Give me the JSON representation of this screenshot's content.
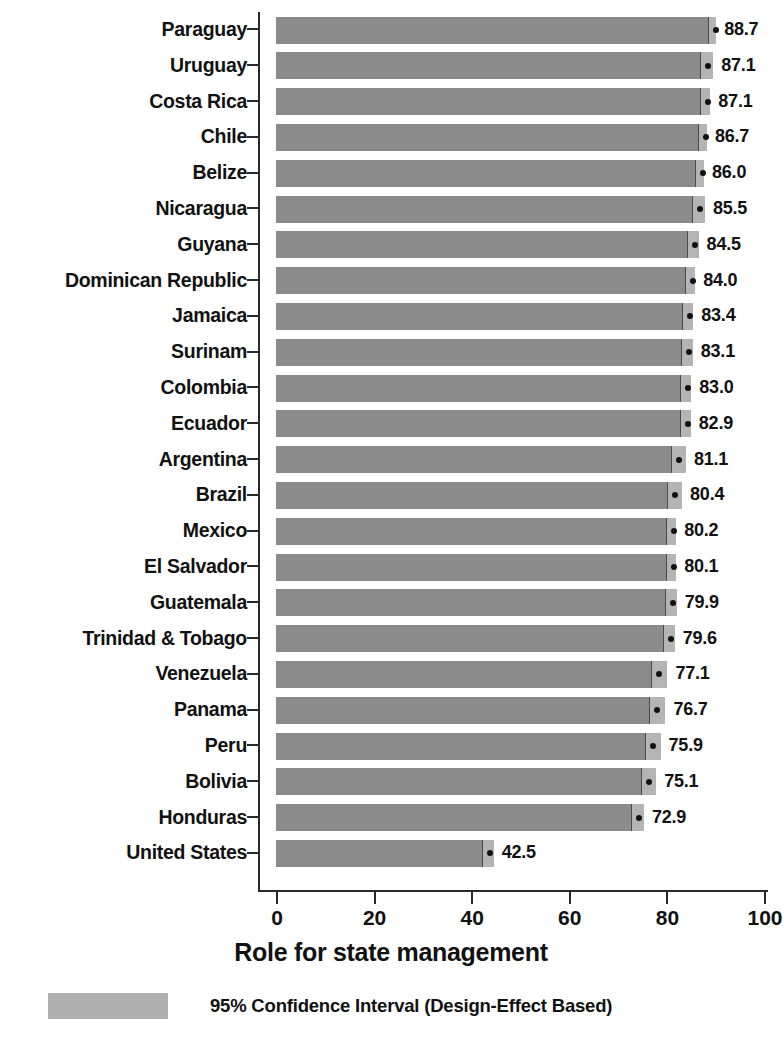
{
  "chart_data": {
    "type": "bar",
    "orientation": "horizontal",
    "title": "",
    "xlabel": "Role for state management",
    "ylabel": "",
    "xlim": [
      0,
      100
    ],
    "xticks": [
      0,
      20,
      40,
      60,
      80,
      100
    ],
    "xtick_labels": [
      "0",
      "20",
      "40",
      "60",
      "80",
      "100"
    ],
    "grid": false,
    "legend_position": "bottom-left",
    "legend": [
      {
        "label": "95% Confidence Interval (Design-Effect Based)",
        "color": "#b0b0b0"
      }
    ],
    "marker_note": "black dot = point estimate",
    "bar_color": "#8b8b8b",
    "ci_color": "#b4b4b4",
    "marker_color": "#111111",
    "categories": [
      "Paraguay",
      "Uruguay",
      "Costa Rica",
      "Chile",
      "Belize",
      "Nicaragua",
      "Guyana",
      "Dominican Republic",
      "Jamaica",
      "Surinam",
      "Colombia",
      "Ecuador",
      "Argentina",
      "Brazil",
      "Mexico",
      "El Salvador",
      "Guatemala",
      "Trinidad & Tobago",
      "Venezuela",
      "Panama",
      "Peru",
      "Bolivia",
      "Honduras",
      "United States"
    ],
    "values": [
      88.7,
      87.1,
      87.1,
      86.7,
      86.0,
      85.5,
      84.5,
      84.0,
      83.4,
      83.1,
      83.0,
      82.9,
      81.1,
      80.4,
      80.2,
      80.1,
      79.9,
      79.6,
      77.1,
      76.7,
      75.9,
      75.1,
      72.9,
      42.5
    ],
    "value_labels": [
      "88.7",
      "87.1",
      "87.1",
      "86.7",
      "86.0",
      "85.5",
      "84.5",
      "84.0",
      "83.4",
      "83.1",
      "83.0",
      "82.9",
      "81.1",
      "80.4",
      "80.2",
      "80.1",
      "79.9",
      "79.6",
      "77.1",
      "76.7",
      "75.9",
      "75.1",
      "72.9",
      "42.5"
    ],
    "ci_upper": [
      90.2,
      89.6,
      89.0,
      88.3,
      87.7,
      87.9,
      86.6,
      85.9,
      85.5,
      85.4,
      85.1,
      85.0,
      84.0,
      83.2,
      82.0,
      82.0,
      82.1,
      81.7,
      80.2,
      79.8,
      78.8,
      77.9,
      75.4,
      44.6
    ]
  }
}
